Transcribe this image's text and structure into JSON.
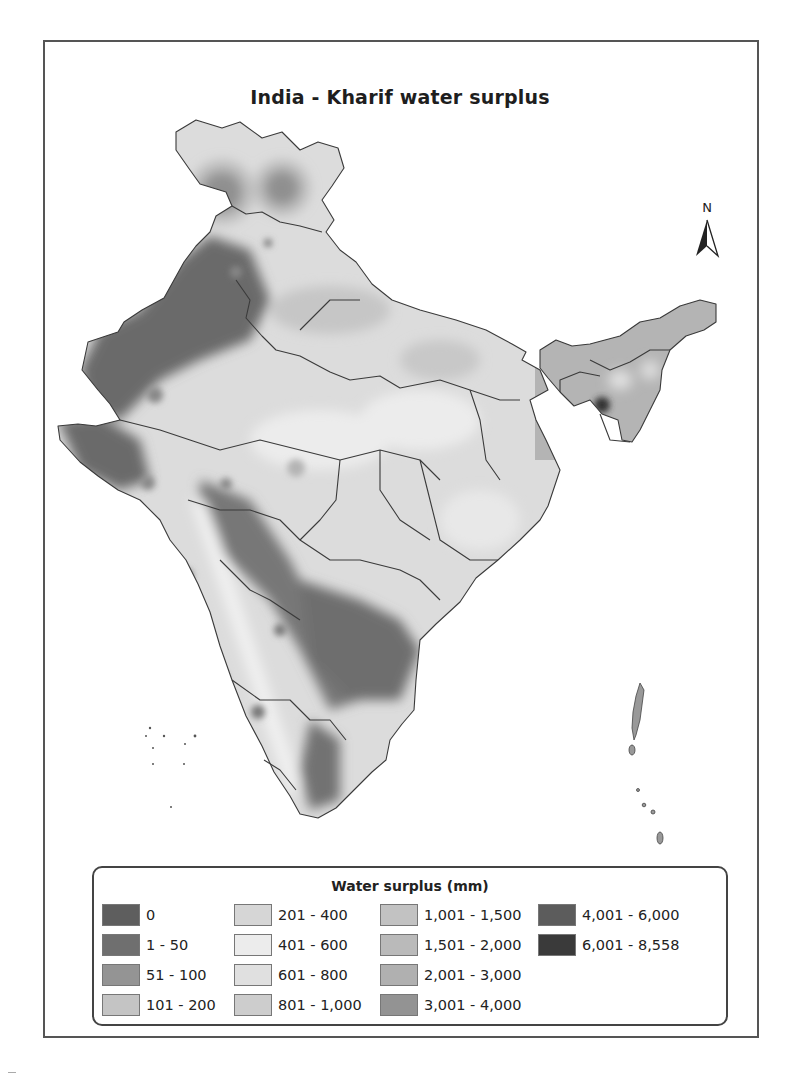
{
  "map": {
    "title": "India - Kharif water surplus",
    "north_arrow": {
      "label": "N",
      "icon": "north-arrow-icon"
    },
    "legend": {
      "title": "Water surplus (mm)",
      "classes": [
        {
          "label": "0",
          "color": "#5e5e5e"
        },
        {
          "label": "1 - 50",
          "color": "#6f6f6f"
        },
        {
          "label": "51 - 100",
          "color": "#949494"
        },
        {
          "label": "101 - 200",
          "color": "#c4c4c4"
        },
        {
          "label": "201 - 400",
          "color": "#d6d6d6"
        },
        {
          "label": "401 - 600",
          "color": "#ececec"
        },
        {
          "label": "601 - 800",
          "color": "#e0e0e0"
        },
        {
          "label": "801 - 1,000",
          "color": "#cdcdcd"
        },
        {
          "label": "1,001 - 1,500",
          "color": "#c2c2c2"
        },
        {
          "label": "1,501 - 2,000",
          "color": "#bababa"
        },
        {
          "label": "2,001 - 3,000",
          "color": "#b0b0b0"
        },
        {
          "label": "3,001 - 4,000",
          "color": "#939393"
        },
        {
          "label": "4,001 - 6,000",
          "color": "#5c5c5c"
        },
        {
          "label": "6,001 - 8,558",
          "color": "#3a3a3a"
        }
      ]
    }
  }
}
